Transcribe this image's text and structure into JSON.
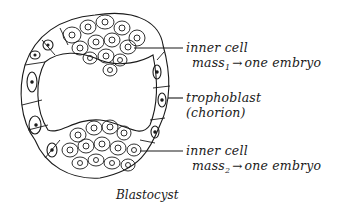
{
  "diagram": {
    "title": "Blastocyst",
    "labels": [
      {
        "id": "icm1",
        "line1": "inner cell",
        "line2_main": "mass",
        "line2_sub": "1",
        "arrow": "→",
        "line2_rest": "one embryo"
      },
      {
        "id": "trophoblast",
        "line1": "trophoblast",
        "line2": "(chorion)"
      },
      {
        "id": "icm2",
        "line1": "inner cell",
        "line2_main": "mass",
        "line2_sub": "2",
        "arrow": "→",
        "line2_rest": "one embryo"
      }
    ],
    "colors": {
      "stroke": "#1a1a1a",
      "background": "#ffffff"
    }
  }
}
